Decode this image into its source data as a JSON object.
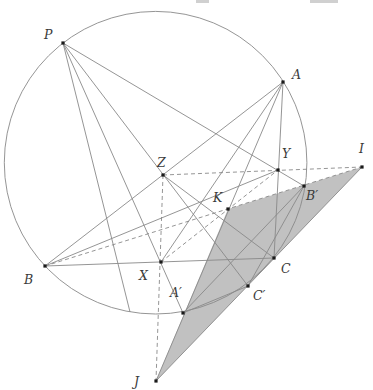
{
  "figure": {
    "width": 373,
    "height": 390,
    "background": "#ffffff",
    "stroke_color": "#898989",
    "stroke_width": 0.9,
    "dash_pattern": "4,3",
    "label_color": "#3a3a3a",
    "label_font_size": 12.5,
    "dot_color": "#1a1a1a",
    "dot_size": 3.2,
    "shade_color": "#c1c1c1",
    "circle": {
      "cx": 155.6,
      "cy": 162.7,
      "r": 151.3
    },
    "shaded_triangle": {
      "vertices": [
        "I",
        "J",
        "K"
      ],
      "fill": "#c1c1c1"
    },
    "points": {
      "P": {
        "x": 63,
        "y": 43,
        "label": "P",
        "label_x": 44,
        "label_y": 39,
        "dot": true
      },
      "A": {
        "x": 283,
        "y": 82,
        "label": "A",
        "label_x": 292,
        "label_y": 79,
        "dot": true
      },
      "B": {
        "x": 45,
        "y": 266,
        "label": "B",
        "label_x": 24,
        "label_y": 284,
        "dot": true
      },
      "C": {
        "x": 274,
        "y": 258,
        "label": "C",
        "label_x": 281,
        "label_y": 273,
        "dot": true
      },
      "X": {
        "x": 161,
        "y": 262,
        "label": "X",
        "label_x": 139,
        "label_y": 280,
        "dot": true
      },
      "Y": {
        "x": 278,
        "y": 170,
        "label": "Y",
        "label_x": 282,
        "label_y": 158,
        "dot": true
      },
      "Z": {
        "x": 163,
        "y": 175,
        "label": "Z",
        "label_x": 157,
        "label_y": 167,
        "dot": true
      },
      "K": {
        "x": 228,
        "y": 209,
        "label": "K",
        "label_x": 213,
        "label_y": 202,
        "dot": true
      },
      "Ap": {
        "x": 183,
        "y": 313,
        "label": "A′",
        "label_x": 170,
        "label_y": 297,
        "dot": true
      },
      "Bp": {
        "x": 304,
        "y": 186,
        "label": "B′",
        "label_x": 306,
        "label_y": 200,
        "dot": true
      },
      "Cp": {
        "x": 248,
        "y": 286,
        "label": "C′",
        "label_x": 253,
        "label_y": 300,
        "dot": true
      },
      "I": {
        "x": 362,
        "y": 167,
        "label": "I",
        "label_x": 359,
        "label_y": 153,
        "dot": true
      },
      "J": {
        "x": 156,
        "y": 381,
        "label": "J",
        "label_x": 134,
        "label_y": 386,
        "dot": true
      },
      "Q": {
        "x": 130,
        "y": 312,
        "label": "",
        "label_x": 0,
        "label_y": 0,
        "dot": false
      }
    },
    "segments": [
      {
        "from": "A",
        "to": "B",
        "style": "solid",
        "name": "side-AB"
      },
      {
        "from": "B",
        "to": "C",
        "style": "solid",
        "name": "side-BC"
      },
      {
        "from": "C",
        "to": "A",
        "style": "solid",
        "name": "side-CA"
      },
      {
        "from": "A",
        "to": "X",
        "style": "solid",
        "name": "median-AX"
      },
      {
        "from": "B",
        "to": "Y",
        "style": "solid",
        "name": "median-BY"
      },
      {
        "from": "C",
        "to": "Z",
        "style": "solid",
        "name": "median-CZ"
      },
      {
        "from": "P",
        "to": "Ap",
        "style": "solid",
        "name": "chord-P-Aprime"
      },
      {
        "from": "P",
        "to": "Bp",
        "style": "solid",
        "name": "chord-P-Bprime"
      },
      {
        "from": "P",
        "to": "Cp",
        "style": "solid",
        "name": "chord-P-Cprime"
      },
      {
        "from": "P",
        "to": "Q",
        "style": "solid",
        "name": "chord-P-arc"
      },
      {
        "from": "A",
        "to": "J",
        "style": "solid",
        "name": "line-A-Aprime-J"
      },
      {
        "from": "J",
        "to": "I",
        "style": "solid",
        "name": "line-J-Cprime-C-I"
      },
      {
        "from": "Ap",
        "to": "Bp",
        "style": "solid",
        "name": "side-Aprime-Bprime"
      },
      {
        "from": "Bp",
        "to": "Cp",
        "style": "solid",
        "name": "side-Bprime-Cprime"
      },
      {
        "from": "Cp",
        "to": "Ap",
        "style": "solid",
        "name": "side-Cprime-Aprime"
      },
      {
        "from": "X",
        "to": "Y",
        "style": "dashed",
        "name": "medial-XY"
      },
      {
        "from": "Z",
        "to": "I",
        "style": "dashed",
        "name": "medial-ZY-ext-I"
      },
      {
        "from": "Z",
        "to": "J",
        "style": "dashed",
        "name": "medial-ZX-ext-J"
      },
      {
        "from": "B",
        "to": "I",
        "style": "dashed",
        "name": "line-B-K-Bprime-I"
      }
    ],
    "artifacts": [
      {
        "x": 196,
        "y": 0,
        "w": 13,
        "h": 3
      },
      {
        "x": 310,
        "y": 0,
        "w": 28,
        "h": 3
      }
    ]
  }
}
